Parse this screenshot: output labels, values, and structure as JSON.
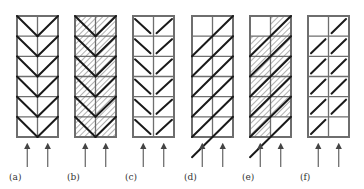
{
  "figure": {
    "colors": {
      "grid": "#6e6e6e",
      "stroke": "#1a1a1a",
      "hatch": "#9a9a9a",
      "arrow": "#555555",
      "background": "#ffffff"
    },
    "grid": {
      "columns": 2,
      "rows": 6
    },
    "panels": [
      {
        "id": "a",
        "label": "(a)",
        "pattern": "chevron-full",
        "hatched": false,
        "x": 17
      },
      {
        "id": "b",
        "label": "(b)",
        "pattern": "chevron-full",
        "hatched": true,
        "x": 75
      },
      {
        "id": "c",
        "label": "(c)",
        "pattern": "chevron-half",
        "hatched": false,
        "x": 133
      },
      {
        "id": "d",
        "label": "(d)",
        "pattern": "diagonal-continuous",
        "hatched": false,
        "x": 192
      },
      {
        "id": "e",
        "label": "(e)",
        "pattern": "diagonal-continuous",
        "hatched": true,
        "x": 250
      },
      {
        "id": "f",
        "label": "(f)",
        "pattern": "diagonal-cell",
        "hatched": false,
        "x": 308
      }
    ],
    "arrows_per_panel": 2,
    "arrow_direction": "up"
  }
}
